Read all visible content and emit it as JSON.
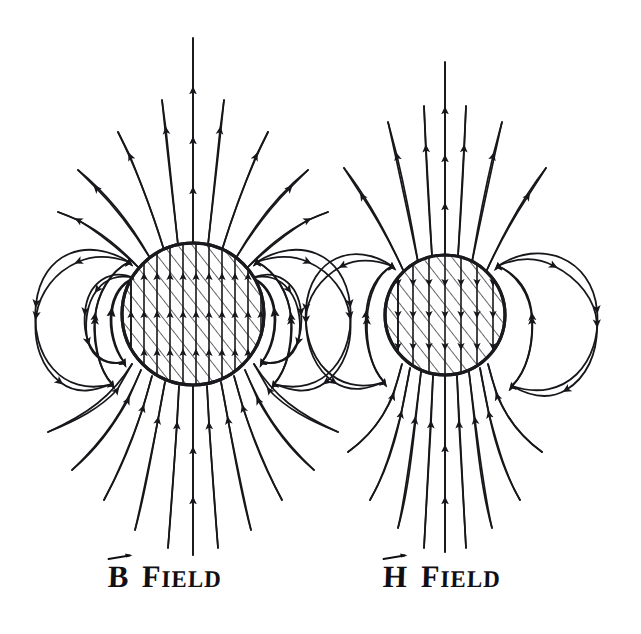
{
  "figure": {
    "background_color": "#ffffff",
    "ink_color": "#17161a",
    "width": 641,
    "height": 634,
    "style": "hand-drawn ink sketch"
  },
  "panels": [
    {
      "id": "b-field",
      "label_vector_letter": "B",
      "label_word": "Field",
      "label_word_first": "F",
      "label_word_rest": "IELD",
      "label_full": "B Field",
      "magnet": {
        "shape": "circle",
        "center_x": 193,
        "center_y": 314,
        "radius": 72,
        "fill": "hatched",
        "hatch_direction": "diagonal-up-right"
      },
      "interior_field": {
        "direction": "up",
        "description": "field lines continue upward through the magnet; B is continuous"
      },
      "exterior_loops_per_side": 2,
      "exterior_field": {
        "north": "lines fan outward and upward from the top pole",
        "south": "lines converge inward and upward into the bottom pole"
      }
    },
    {
      "id": "h-field",
      "label_vector_letter": "H",
      "label_word": "Field",
      "label_word_first": "F",
      "label_word_rest": "IELD",
      "label_full": "H Field",
      "magnet": {
        "shape": "circle",
        "center_x": 445,
        "center_y": 315,
        "radius": 61,
        "fill": "hatched",
        "hatch_direction": "diagonal-up-right"
      },
      "interior_field": {
        "direction": "down",
        "description": "field lines reverse inside the magnet; H opposes the magnetization"
      },
      "exterior_loops_per_side": 1,
      "exterior_field": {
        "north": "lines fan outward and upward from the top pole",
        "south": "lines converge inward and upward into the bottom pole"
      }
    }
  ],
  "labels": {
    "left": {
      "vector_letter": "B",
      "word_cap": "F",
      "word_rest": "IELD",
      "x": 108,
      "y": 552
    },
    "right": {
      "vector_letter": "H",
      "word_cap": "F",
      "word_rest": "IELD",
      "x": 383,
      "y": 552
    }
  }
}
